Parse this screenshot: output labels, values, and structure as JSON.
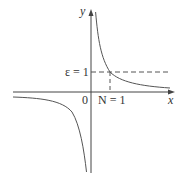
{
  "figure": {
    "function": "y = 1/x",
    "axes": {
      "x_label": "x",
      "y_label": "y",
      "origin_label": "0"
    },
    "annotations": {
      "epsilon_label": "ε = 1",
      "N_label": "N = 1"
    },
    "colors": {
      "axis": "#444444",
      "curve": "#555555",
      "dashed": "#555555",
      "text": "#333333"
    }
  }
}
